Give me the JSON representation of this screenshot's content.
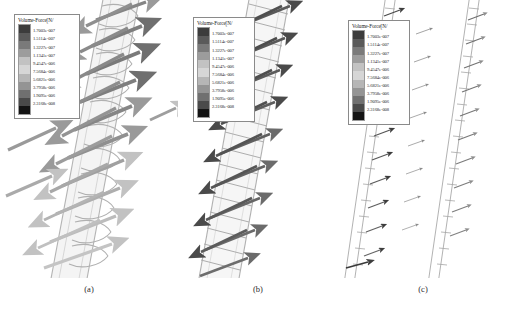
{
  "figure": {
    "background_color": "#ffffff",
    "panels": [
      {
        "id": "a",
        "caption": "(a)",
        "description": "Volume force vectors on helical coil, large light-gray arrows"
      },
      {
        "id": "b",
        "caption": "(b)",
        "description": "Volume force vectors on helical coil, dark crossed arrow pairs"
      },
      {
        "id": "c",
        "caption": "(c)",
        "description": "Volume force vectors on helical coil, small thin arrows"
      }
    ]
  },
  "legend": {
    "title": "Volume-Force[N/",
    "unit": "N/",
    "entries": [
      {
        "value": "1.7003e-007",
        "color": "#4e4e4e"
      },
      {
        "value": "1.5114e-007",
        "color": "#6e6e6e"
      },
      {
        "value": "1.3227e-007",
        "color": "#8c8c8c"
      },
      {
        "value": "1.1341e-007",
        "color": "#b0b0b0"
      },
      {
        "value": "9.4547e-006",
        "color": "#cfcfcf"
      },
      {
        "value": "7.5684e-006",
        "color": "#bdbdbd"
      },
      {
        "value": "5.6821e-006",
        "color": "#9a9a9a"
      },
      {
        "value": "3.7958e-006",
        "color": "#808080"
      },
      {
        "value": "1.9095e-006",
        "color": "#5a5a5a"
      },
      {
        "value": "2.3168e-008",
        "color": "#1c1c1c"
      }
    ],
    "swatch_colors": [
      "#3c3c3c",
      "#5a5a5a",
      "#7a7a7a",
      "#9c9c9c",
      "#c2c2c2",
      "#d6d6d6",
      "#b6b6b6",
      "#949494",
      "#707070",
      "#4a4a4a",
      "#141414"
    ]
  },
  "colors": {
    "arrow_light": "#b9b9b9",
    "arrow_mid": "#8d8d8d",
    "arrow_dark": "#5c5c5c",
    "arrow_verydark": "#3a3a3a",
    "coil_line": "#a8a8a8",
    "coil_fill": "#f2f2f2",
    "legend_border": "#8a8a8a",
    "text": "#1c1c1c"
  }
}
